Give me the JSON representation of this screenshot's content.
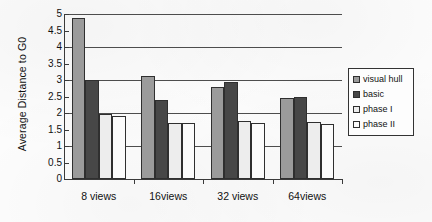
{
  "chart_data": {
    "type": "bar",
    "title": "",
    "xlabel": "",
    "ylabel": "Average Distance to G0",
    "categories": [
      "8 views",
      "16views",
      "32 views",
      "64views"
    ],
    "series": [
      {
        "name": "visual hull",
        "color": "#9b9b9b",
        "values": [
          4.87,
          3.12,
          2.78,
          2.45
        ]
      },
      {
        "name": "basic",
        "color": "#474747",
        "values": [
          3.0,
          2.4,
          2.95,
          2.5
        ]
      },
      {
        "name": "phase I",
        "color": "#ededed",
        "values": [
          1.98,
          1.7,
          1.75,
          1.72
        ]
      },
      {
        "name": "phase II",
        "color": "#fbfbfb",
        "values": [
          1.92,
          1.7,
          1.7,
          1.68
        ]
      }
    ],
    "ylim": [
      0,
      5
    ],
    "yticks": [
      "0",
      "0.5",
      "1",
      "1.5",
      "2",
      "2.5",
      "3",
      "3.5",
      "4",
      "4.5",
      "5"
    ],
    "ytick_values": [
      0,
      0.5,
      1,
      1.5,
      2,
      2.5,
      3,
      3.5,
      4,
      4.5,
      5
    ],
    "gridlines_major": [
      1,
      2,
      3,
      4,
      5
    ],
    "grid": true,
    "legend_position": "right"
  },
  "legend": {
    "items": [
      {
        "label": "visual hull",
        "color": "#9b9b9b"
      },
      {
        "label": "basic",
        "color": "#474747"
      },
      {
        "label": "phase I",
        "color": "#ededed"
      },
      {
        "label": "phase II",
        "color": "#fbfbfb"
      }
    ]
  }
}
